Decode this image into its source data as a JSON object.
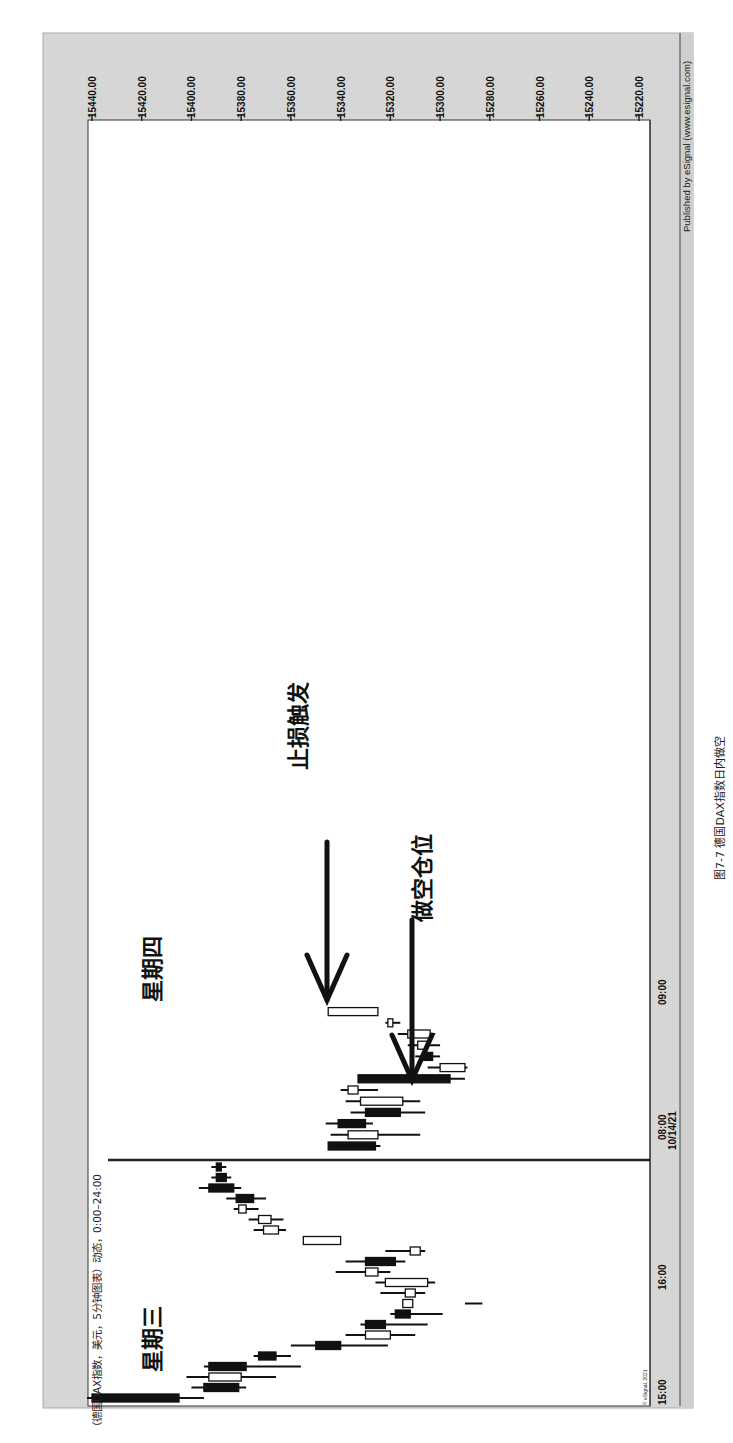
{
  "chart_data": {
    "type": "candlestick",
    "orientation": "rotated-90-clockwise",
    "title": "（德国DAX指数，美元，5分钟图表）动态，0:00–24:00",
    "instrument": "德国DAX指数",
    "currency": "美元",
    "interval": "5分钟",
    "session": "0:00–24:00",
    "price_axis": {
      "ticks": [
        "15440.00",
        "15420.00",
        "15400.00",
        "15380.00",
        "15360.00",
        "15340.00",
        "15320.00",
        "15300.00",
        "15280.00",
        "15260.00",
        "15240.00",
        "15220.00"
      ],
      "range": [
        15220,
        15440
      ]
    },
    "time_axis": {
      "ticks": [
        "15:00",
        "16:00",
        "08:00",
        "09:00"
      ],
      "date_label": "10/14/21"
    },
    "day_labels": [
      "星期三",
      "星期四"
    ],
    "annotations": [
      {
        "text": "止损触发",
        "type": "arrow-down",
        "points_to": "white candle near 15345 after 09:00"
      },
      {
        "text": "做空仓位",
        "type": "arrow-down",
        "points_to": "candle near 15310 before 09:00"
      }
    ],
    "wednesday_candles": [
      {
        "color": "black",
        "open": 15440,
        "close": 15405,
        "high": 15442,
        "low": 15395
      },
      {
        "color": "black",
        "open": 15395,
        "close": 15381,
        "high": 15400,
        "low": 15378
      },
      {
        "color": "white",
        "open": 15380,
        "close": 15393,
        "high": 15402,
        "low": 15366
      },
      {
        "color": "black",
        "open": 15393,
        "close": 15378,
        "high": 15395,
        "low": 15356
      },
      {
        "color": "black",
        "open": 15373,
        "close": 15366,
        "high": 15375,
        "low": 15360
      },
      {
        "color": "black",
        "open": 15350,
        "close": 15340,
        "high": 15360,
        "low": 15321
      },
      {
        "color": "white",
        "open": 15320,
        "close": 15330,
        "high": 15338,
        "low": 15310
      },
      {
        "color": "black",
        "open": 15330,
        "close": 15322,
        "high": 15332,
        "low": 15305
      },
      {
        "color": "black",
        "open": 15318,
        "close": 15312,
        "high": 15320,
        "low": 15299
      },
      {
        "color": "white",
        "open": 15315,
        "close": 15311,
        "high": 15290,
        "low": 15283
      },
      {
        "color": "white",
        "open": 15310,
        "close": 15314,
        "high": 15324,
        "low": 15306
      },
      {
        "color": "white",
        "open": 15305,
        "close": 15322,
        "high": 15326,
        "low": 15302
      },
      {
        "color": "white",
        "open": 15325,
        "close": 15330,
        "high": 15342,
        "low": 15320
      },
      {
        "color": "black",
        "open": 15330,
        "close": 15318,
        "high": 15338,
        "low": 15314
      },
      {
        "color": "white",
        "open": 15308,
        "close": 15312,
        "high": 15322,
        "low": 15306
      },
      {
        "color": "white",
        "open": 15340,
        "close": 15355,
        "high": 15355,
        "low": 15340
      },
      {
        "color": "white",
        "open": 15371,
        "close": 15365,
        "high": 15375,
        "low": 15362
      },
      {
        "color": "white",
        "open": 15373,
        "close": 15368,
        "high": 15377,
        "low": 15363
      },
      {
        "color": "white",
        "open": 15381,
        "close": 15378,
        "high": 15383,
        "low": 15373
      },
      {
        "color": "black",
        "open": 15382,
        "close": 15375,
        "high": 15386,
        "low": 15370
      },
      {
        "color": "black",
        "open": 15393,
        "close": 15383,
        "high": 15397,
        "low": 15380
      },
      {
        "color": "black",
        "open": 15390,
        "close": 15386,
        "high": 15392,
        "low": 15384
      },
      {
        "color": "black",
        "open": 15390,
        "close": 15388,
        "high": 15392,
        "low": 15386
      }
    ],
    "thursday_candles": [
      {
        "color": "black",
        "open": 15345,
        "close": 15326,
        "high": 15345,
        "low": 15324
      },
      {
        "color": "white",
        "open": 15337,
        "close": 15325,
        "high": 15344,
        "low": 15308
      },
      {
        "color": "black",
        "open": 15341,
        "close": 15330,
        "high": 15346,
        "low": 15327
      },
      {
        "color": "black",
        "open": 15330,
        "close": 15316,
        "high": 15336,
        "low": 15306
      },
      {
        "color": "white",
        "open": 15332,
        "close": 15315,
        "high": 15338,
        "low": 15308
      },
      {
        "color": "white",
        "open": 15337,
        "close": 15333,
        "high": 15340,
        "low": 15325
      },
      {
        "color": "black",
        "open": 15333,
        "close": 15296,
        "high": 15333,
        "low": 15290
      },
      {
        "color": "white",
        "open": 15300,
        "close": 15290,
        "high": 15305,
        "low": 15289
      },
      {
        "color": "black",
        "open": 15307,
        "close": 15303,
        "high": 15310,
        "low": 15300
      },
      {
        "color": "white",
        "open": 15309,
        "close": 15305,
        "high": 15313,
        "low": 15300
      },
      {
        "color": "white",
        "open": 15313,
        "close": 15304,
        "high": 15317,
        "low": 15302
      },
      {
        "color": "white",
        "open": 15321,
        "close": 15319,
        "high": 15322,
        "low": 15316
      },
      {
        "color": "white",
        "open": 15345,
        "close": 15325,
        "high": 15345,
        "low": 15325
      }
    ]
  },
  "labels": {
    "published": "Published by eSignal (www.esignal.com)",
    "copyright": "© eSignal, 2021",
    "caption": "图7-7 德国DAX指数日内做空"
  }
}
